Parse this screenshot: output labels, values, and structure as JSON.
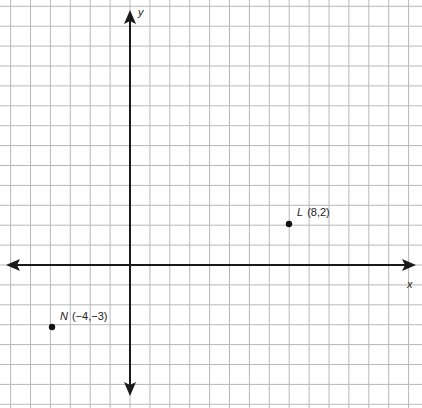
{
  "chart_data": {
    "type": "scatter",
    "title": "",
    "xlabel": "x",
    "ylabel": "y",
    "grid": true,
    "xlim": [
      -6,
      14
    ],
    "ylim": [
      -6,
      13
    ],
    "points": [
      {
        "name": "L",
        "x": 8,
        "y": 2,
        "label": "(8,2)"
      },
      {
        "name": "N",
        "x": -4,
        "y": -3,
        "label": "(−4,−3)"
      }
    ]
  },
  "axes": {
    "x_label": "x",
    "y_label": "y"
  },
  "points": {
    "L": {
      "name": "L",
      "coords": "(8,2)"
    },
    "N": {
      "name": "N",
      "coords": "(−4,−3)"
    }
  },
  "colors": {
    "grid": "#b8b8b8",
    "axis": "#1a1a1a",
    "point": "#111111"
  }
}
